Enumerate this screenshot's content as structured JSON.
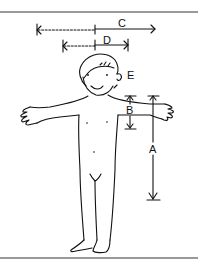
{
  "diagram": {
    "labels": {
      "A": "A",
      "B": "B",
      "C": "C",
      "D": "D",
      "E": "E"
    },
    "measurements": [
      {
        "id": "A",
        "orientation": "vertical",
        "meaning": "shoulder to wrist-level arm length / body height segment"
      },
      {
        "id": "B",
        "orientation": "vertical",
        "meaning": "shoulder to armpit / upper arm segment"
      },
      {
        "id": "C",
        "orientation": "horizontal",
        "meaning": "half arm span (dashed extension to full)"
      },
      {
        "id": "D",
        "orientation": "horizontal",
        "meaning": "shorter horizontal span"
      },
      {
        "id": "E",
        "orientation": "point",
        "meaning": "ear / neck reference"
      }
    ],
    "colors": {
      "ink": "#111111",
      "frame": "#777777",
      "background": "#ffffff"
    }
  }
}
